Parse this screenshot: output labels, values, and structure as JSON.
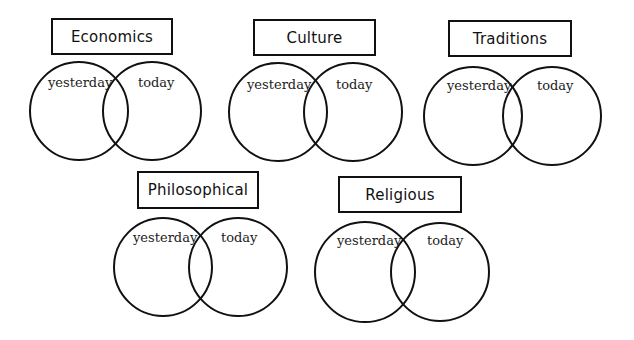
{
  "diagram": {
    "background": "#ffffff",
    "stroke_color": "#111111",
    "diagrams": [
      {
        "title": "Economics",
        "box": {
          "x": 51,
          "y": 18,
          "w": 122,
          "h": 37
        },
        "left_circle": {
          "cx": 79,
          "cy": 111,
          "r": 50,
          "label": "yesterday",
          "label_pos": {
            "x": 48,
            "y": 76
          }
        },
        "right_circle": {
          "cx": 152,
          "cy": 111,
          "r": 50,
          "label": "today",
          "label_pos": {
            "x": 138,
            "y": 76
          }
        }
      },
      {
        "title": "Culture",
        "box": {
          "x": 253,
          "y": 19,
          "w": 123,
          "h": 37
        },
        "left_circle": {
          "cx": 278,
          "cy": 112,
          "r": 50,
          "label": "yesterday",
          "label_pos": {
            "x": 247,
            "y": 78
          }
        },
        "right_circle": {
          "cx": 353,
          "cy": 112,
          "r": 50,
          "label": "today",
          "label_pos": {
            "x": 336,
            "y": 78
          }
        }
      },
      {
        "title": "Traditions",
        "box": {
          "x": 448,
          "y": 20,
          "w": 124,
          "h": 37
        },
        "left_circle": {
          "cx": 473,
          "cy": 116,
          "r": 50,
          "label": "yesterday",
          "label_pos": {
            "x": 447,
            "y": 79
          }
        },
        "right_circle": {
          "cx": 552,
          "cy": 116,
          "r": 50,
          "label": "today",
          "label_pos": {
            "x": 537,
            "y": 79
          }
        }
      },
      {
        "title": "Philosophical",
        "box": {
          "x": 137,
          "y": 171,
          "w": 122,
          "h": 38
        },
        "left_circle": {
          "cx": 163,
          "cy": 267,
          "r": 50,
          "label": "yesterday",
          "label_pos": {
            "x": 133,
            "y": 231
          }
        },
        "right_circle": {
          "cx": 238,
          "cy": 267,
          "r": 50,
          "label": "today",
          "label_pos": {
            "x": 221,
            "y": 231
          }
        }
      },
      {
        "title": "Religious",
        "box": {
          "x": 338,
          "y": 176,
          "w": 124,
          "h": 37
        },
        "left_circle": {
          "cx": 365,
          "cy": 272,
          "r": 51,
          "label": "yesterday",
          "label_pos": {
            "x": 337,
            "y": 234
          }
        },
        "right_circle": {
          "cx": 440,
          "cy": 272,
          "r": 50,
          "label": "today",
          "label_pos": {
            "x": 427,
            "y": 234
          }
        }
      }
    ]
  }
}
